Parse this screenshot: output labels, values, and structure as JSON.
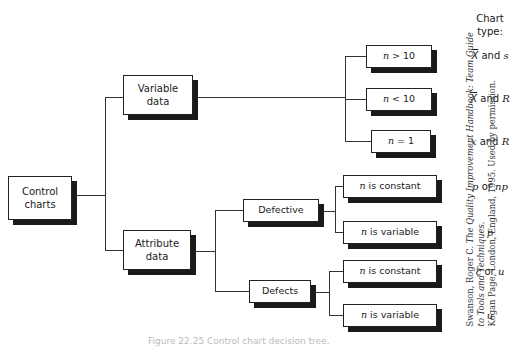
{
  "diagram": {
    "root": {
      "label_line1": "Control",
      "label_line2": "charts"
    },
    "branches": {
      "variable": {
        "label_line1": "Variable",
        "label_line2": "data"
      },
      "attribute": {
        "label_line1": "Attribute",
        "label_line2": "data"
      }
    },
    "variable_conditions": [
      {
        "var": "n",
        "rest": " > 10",
        "chart_type": {
          "a": "X",
          "mid": " and ",
          "b": "s",
          "a_bar": true
        }
      },
      {
        "var": "n",
        "rest": " < 10",
        "chart_type": {
          "a": "X",
          "mid": " and ",
          "b": "R",
          "a_bar": true
        }
      },
      {
        "var": "n",
        "rest": " = 1",
        "chart_type": {
          "a": "x",
          "mid": " and ",
          "b": "R",
          "a_bar": false
        }
      }
    ],
    "attribute_groups": {
      "defective": {
        "label": "Defective",
        "conditions": [
          {
            "var": "n",
            "rest": " is constant",
            "chart_type": {
              "a": "p",
              "mid": " or ",
              "b": "np"
            }
          },
          {
            "var": "n",
            "rest": " is variable",
            "chart_type": {
              "a": "p",
              "mid": "",
              "b": ""
            }
          }
        ]
      },
      "defects": {
        "label": "Defects",
        "conditions": [
          {
            "var": "n",
            "rest": " is constant",
            "chart_type": {
              "a": "c",
              "mid": " or ",
              "b": "u"
            }
          },
          {
            "var": "n",
            "rest": " is variable",
            "chart_type": {
              "a": "u",
              "mid": "",
              "b": ""
            }
          }
        ]
      }
    },
    "chart_type_header": {
      "line1": "Chart",
      "line2": "type:"
    }
  },
  "credit": {
    "line1_prefix": "Swanson, Roger C. ",
    "line1_title": "The Quality Improvement Handbook: Team Guide to Tools and Techniques.",
    "line2": "Kogan Page, London, England, 1995. Used by permission."
  },
  "caption": "Figure 22.25  Control chart decision tree."
}
